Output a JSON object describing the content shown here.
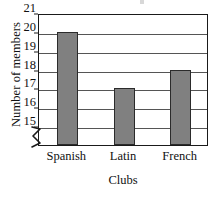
{
  "chart_data": {
    "type": "bar",
    "title": "",
    "categories": [
      "Spanish",
      "Latin",
      "French"
    ],
    "values": [
      20,
      17,
      18
    ],
    "series": [
      {
        "name": "Number of members",
        "values": [
          20,
          17,
          18
        ]
      }
    ],
    "xlabel": "Clubs",
    "ylabel": "Number of members",
    "ylim": [
      14,
      21
    ],
    "yticks": [
      15,
      16,
      17,
      18,
      19,
      20,
      21
    ],
    "ytick_labels": [
      "15",
      "16",
      "17",
      "18",
      "19",
      "20",
      "21"
    ],
    "axis_break": true,
    "axis_break_note": "y-axis broken below 15",
    "grid": true,
    "grid_axis": "y",
    "legend": false,
    "legend_position": "none",
    "bar_fill_color": "#808080",
    "bar_edge_color": "#2b2b2b",
    "frame_color": "#1a1a1a",
    "gridline_color": "#555555",
    "background_color": "#ffffff"
  }
}
